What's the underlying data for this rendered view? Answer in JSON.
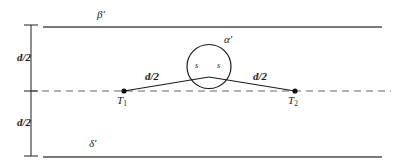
{
  "figure": {
    "type": "geometric-diagram",
    "colors": {
      "line": "#4d4d4d",
      "construction": "#1a1a1a",
      "dashed": "#808080",
      "text": "#1a1a1a",
      "background": "#ffffff"
    }
  },
  "labels": {
    "beta_prime": "β′",
    "alpha_prime": "α′",
    "delta_prime": "δ′",
    "d_half_upper": "d/2",
    "d_half_lower": "d/2",
    "d_half_left_leg": "d/2",
    "d_half_right_leg": "d/2",
    "s_left": "s",
    "s_right": "s",
    "t1": "T",
    "t1_sub": "1",
    "t2": "T",
    "t2_sub": "2"
  },
  "geometry": {
    "top_line": {
      "x1": 43,
      "y": 27,
      "x2": 382
    },
    "bottom_line": {
      "x1": 43,
      "y": 157,
      "x2": 382
    },
    "center_dashed_line": {
      "x1": 30,
      "y": 91,
      "x2": 390
    },
    "dimension_axis": {
      "x": 31,
      "y_top": 25,
      "y_bottom": 156
    },
    "dimension_ticks": [
      25,
      91,
      156
    ],
    "circle": {
      "cx": 209,
      "cy": 66.5,
      "r": 22
    },
    "point_t1": {
      "x": 124,
      "y": 91
    },
    "point_t2": {
      "x": 295,
      "y": 91
    },
    "apex": {
      "x": 209,
      "y": 77
    },
    "chord_left": {
      "x": 188,
      "y": 72
    },
    "chord_right": {
      "x": 230,
      "y": 72
    }
  }
}
